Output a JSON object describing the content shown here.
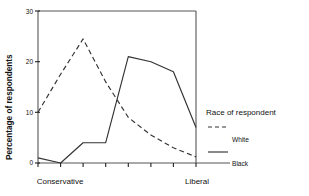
{
  "chart_data": {
    "type": "line",
    "title": "",
    "xlabel": "",
    "ylabel": "Percentage of respondents",
    "ylim": [
      0,
      30
    ],
    "yticks": [
      0,
      10,
      20,
      30
    ],
    "ytick_labels": [
      "0",
      "10",
      "20",
      "30"
    ],
    "x": [
      1,
      2,
      3,
      4,
      5,
      6,
      7,
      8
    ],
    "xlim": [
      1,
      8
    ],
    "x_axis_endpoint_labels": {
      "left": "Conservative",
      "right": "Liberal"
    },
    "grid": false,
    "n_xticks": 8,
    "series": [
      {
        "name": "White",
        "style": "dashed",
        "color": "#333333",
        "values": [
          10.0,
          17.5,
          24.5,
          16.0,
          9.0,
          5.5,
          3.0,
          1.2
        ]
      },
      {
        "name": "Black",
        "style": "solid",
        "color": "#333333",
        "values": [
          1.0,
          0.0,
          4.0,
          4.0,
          21.0,
          20.0,
          18.0,
          7.0
        ]
      }
    ],
    "legend": {
      "title": "Race of respondent",
      "position": "right",
      "entries": [
        {
          "label": "White",
          "style": "dashed"
        },
        {
          "label": "Black",
          "style": "solid"
        }
      ]
    }
  }
}
